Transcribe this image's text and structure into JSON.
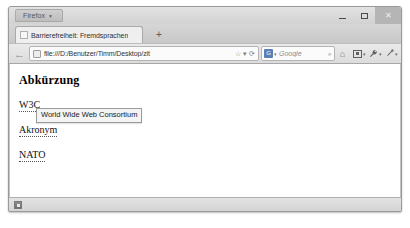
{
  "window": {
    "app_menu_label": "Firefox",
    "app_menu_caret": "▼",
    "controls": {
      "minimize": "minimize-button",
      "maximize": "maximize-button",
      "close_label": "✕"
    }
  },
  "tabs": {
    "active_tab_title": "Barrierefreiheit: Fremdsprachen",
    "new_tab_label": "+"
  },
  "toolbar": {
    "back_label": "←",
    "url_value": "file:///D:/Benutzer/Timm/Desktop/zit",
    "bookmark_star": "☆",
    "dropmarker": "▾",
    "reload_label": "⟳",
    "search_engine": "G",
    "search_engine_caret": "▾",
    "search_placeholder": "Google",
    "search_go": "⌕",
    "home_label": "⌂",
    "caret": "▾"
  },
  "page": {
    "heading": "Abkürzung",
    "abbreviations": [
      {
        "text": "W3C",
        "title": "World Wide Web Consortium"
      },
      {
        "text": "Akronym",
        "title": ""
      },
      {
        "text": "NATO",
        "title": ""
      }
    ],
    "tooltip_text": "World Wide Web Consortium"
  },
  "statusbar": {
    "addon_icon": "addon-status-icon"
  }
}
